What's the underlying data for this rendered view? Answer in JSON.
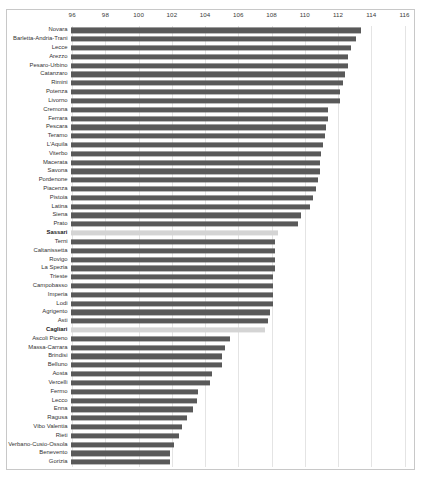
{
  "chart_data": {
    "type": "bar",
    "orientation": "horizontal",
    "title": "",
    "subtitle": "",
    "xlabel": "",
    "ylabel": "",
    "xlim": [
      95.9,
      116.6
    ],
    "xticks": [
      96,
      98,
      100,
      102,
      104,
      106,
      108,
      110,
      112,
      114,
      116
    ],
    "xtick_labels": [
      "96",
      "98",
      "100",
      "102",
      "104",
      "106",
      "108",
      "110",
      "112",
      "114",
      "116"
    ],
    "grid": true,
    "grid_axis": "x",
    "legend": null,
    "legend_position": "none",
    "bar_color": "#595959",
    "highlight_color": "#d4d4d4",
    "highlighted_categories": [
      "Sassari",
      "Cagliari"
    ],
    "categories": [
      "Novara",
      "Barletta-Andria-Trani",
      "Lecce",
      "Arezzo",
      "Pesaro-Urbino",
      "Catanzaro",
      "Rimini",
      "Potenza",
      "Livorno",
      "Cremona",
      "Ferrara",
      "Pescara",
      "Teramo",
      "L'Aquila",
      "Viterbo",
      "Macerata",
      "Savona",
      "Pordenone",
      "Piacenza",
      "Pistoia",
      "Latina",
      "Siena",
      "Prato",
      "Sassari",
      "Terni",
      "Caltanissetta",
      "Rovigo",
      "La Spezia",
      "Trieste",
      "Campobasso",
      "Imperia",
      "Lodi",
      "Agrigento",
      "Asti",
      "Cagliari",
      "Ascoli Piceno",
      "Massa-Carrara",
      "Brindisi",
      "Belluno",
      "Aosta",
      "Vercelli",
      "Fermo",
      "Lecco",
      "Enna",
      "Ragusa",
      "Vibo Valentia",
      "Rieti",
      "Verbano-Cusio-Ossola",
      "Benevento",
      "Gorizia"
    ],
    "values": [
      113.4,
      113.1,
      112.8,
      112.6,
      112.6,
      112.4,
      112.3,
      112.1,
      112.1,
      111.4,
      111.4,
      111.3,
      111.2,
      111.1,
      111.0,
      110.9,
      110.9,
      110.8,
      110.7,
      110.5,
      110.3,
      109.8,
      109.6,
      108.4,
      108.2,
      108.2,
      108.2,
      108.2,
      108.1,
      108.1,
      108.1,
      108.1,
      107.9,
      107.8,
      107.6,
      105.5,
      105.2,
      105.0,
      105.0,
      104.4,
      104.3,
      103.6,
      103.5,
      103.3,
      102.9,
      102.6,
      102.4,
      102.1,
      101.9,
      101.9
    ]
  }
}
